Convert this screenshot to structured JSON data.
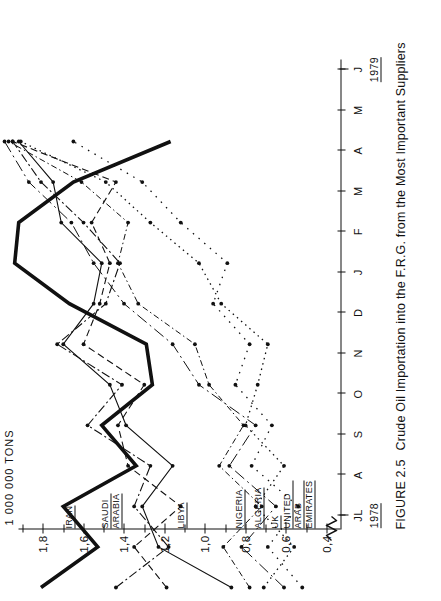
{
  "figure": {
    "number": "FIGURE 2.5",
    "caption": "Crude Oil Importation into the F.R.G. from the Most Important Suppliers"
  },
  "axis_title": "1 000 000 TONS",
  "year_labels": {
    "start": "1978",
    "end": "1979"
  },
  "chart_data": {
    "type": "line",
    "title": "Crude Oil Importation into the F.R.G. from the Most Important Suppliers",
    "xlabel": "",
    "ylabel": "1 000 000 TONS",
    "x": [
      "JL",
      "A",
      "S",
      "O",
      "N",
      "D",
      "J",
      "F",
      "M",
      "A",
      "M",
      "J"
    ],
    "x_tick_labels": [
      "JL",
      "A",
      "S",
      "O",
      "N",
      "D",
      "J",
      "F",
      "M",
      "A",
      "M",
      "J"
    ],
    "y_tick_labels": [
      "1,8",
      "1,6",
      "1,4",
      "1,2",
      "1,0",
      "0,8",
      "0,6",
      "0,4"
    ],
    "y_tick_values": [
      1.8,
      1.6,
      1.4,
      1.2,
      1.0,
      0.8,
      0.6,
      0.4
    ],
    "ylim": [
      0.33,
      1.92
    ],
    "grid": false,
    "legend": "inline-axis-labels",
    "series": [
      {
        "name": "IRAN",
        "label": "IRAN",
        "style": "solid-thick",
        "axis_label_value": 1.63,
        "values": [
          1.72,
          1.44,
          1.61,
          1.25,
          1.42,
          1.17,
          1.2,
          1.58,
          1.85,
          1.83,
          1.56,
          1.08
        ]
      },
      {
        "name": "SAUDI ARABIA",
        "label": "SAUDI\nARABIA",
        "style": "dash-dot",
        "axis_label_value": 1.4,
        "values": [
          1.35,
          1.09,
          1.26,
          1.18,
          1.49,
          1.32,
          1.64,
          1.4,
          1.33,
          1.51,
          1.72,
          1.86
        ]
      },
      {
        "name": "LIBYA",
        "label": "LIBYA",
        "style": "dashed",
        "axis_label_value": 1.08,
        "values": [
          1.1,
          1.26,
          1.03,
          1.29,
          1.34,
          1.21,
          1.51,
          1.43,
          1.38,
          1.47,
          1.35,
          1.86
        ]
      },
      {
        "name": "NIGERIA",
        "label": "NIGERIA",
        "style": "solid-thin",
        "axis_label_value": 0.79,
        "values": [
          0.78,
          1.14,
          1.22,
          1.07,
          1.3,
          1.38,
          1.61,
          1.46,
          1.42,
          1.62,
          1.66,
          1.83
        ]
      },
      {
        "name": "ALGERIA",
        "label": "ALGERIA",
        "style": "dash-dot-thin",
        "axis_label_value": 0.7,
        "values": [
          0.69,
          0.82,
          0.63,
          0.84,
          0.72,
          0.89,
          0.96,
          1.24,
          1.34,
          1.29,
          1.52,
          1.88
        ]
      },
      {
        "name": "UK",
        "label": "UK",
        "style": "dotted",
        "axis_label_value": 0.615,
        "values": [
          0.62,
          0.47,
          0.66,
          0.52,
          0.71,
          0.65,
          0.6,
          0.83,
          0.94,
          1.18,
          1.4,
          1.82
        ]
      },
      {
        "name": "UNITED ARAB EMIRATES",
        "label": "UNITED\nARAB\nEMIRATES",
        "style": "dotted-loose",
        "axis_label_value": 0.45,
        "values": [
          0.43,
          0.6,
          0.45,
          0.68,
          0.58,
          0.76,
          0.69,
          0.87,
          0.8,
          1.03,
          1.22,
          1.56
        ]
      },
      {
        "name": "OTHER",
        "label": "",
        "style": "dashdot-sparse",
        "axis_label_value": null,
        "values": [
          0.52,
          0.73,
          0.56,
          0.79,
          0.66,
          0.94,
          1.07,
          1.31,
          1.46,
          1.57,
          1.78,
          1.9
        ]
      }
    ]
  }
}
